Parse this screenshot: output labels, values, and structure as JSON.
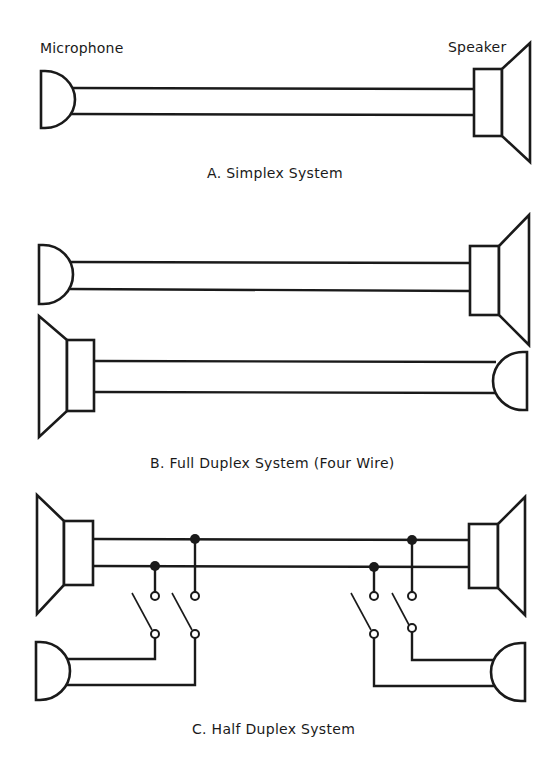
{
  "labels": {
    "microphone": "Microphone",
    "speaker": "Speaker"
  },
  "captions": {
    "a": "A. Simplex System",
    "b": "B. Full Duplex System (Four Wire)",
    "c": "C. Half Duplex System"
  },
  "colors": {
    "ink": "#1a1a1a",
    "background": "#ffffff"
  },
  "components": {
    "microphone_icon": "microphone-half-dome",
    "speaker_icon": "speaker-box-cone",
    "switch_icon": "spst-switch",
    "junction_icon": "solid-junction-dot"
  }
}
